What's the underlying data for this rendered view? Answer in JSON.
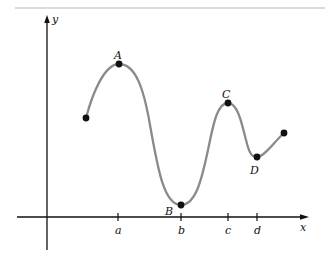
{
  "figure": {
    "axes": {
      "x_label": "x",
      "y_label": "y"
    },
    "ticks": [
      {
        "label": "a",
        "x": 118
      },
      {
        "label": "b",
        "x": 181
      },
      {
        "label": "c",
        "x": 228
      },
      {
        "label": "d",
        "x": 257
      }
    ],
    "points": [
      {
        "label": "",
        "x": 86,
        "y": 118
      },
      {
        "label": "A",
        "x": 119,
        "y": 64
      },
      {
        "label": "B",
        "x": 181,
        "y": 205
      },
      {
        "label": "C",
        "x": 228,
        "y": 103
      },
      {
        "label": "D",
        "x": 257,
        "y": 157
      },
      {
        "label": "",
        "x": 284,
        "y": 133
      }
    ],
    "colors": {
      "curve": "#8a8a8a",
      "axis": "#111111",
      "top_rule": "#b5b5b5"
    }
  }
}
